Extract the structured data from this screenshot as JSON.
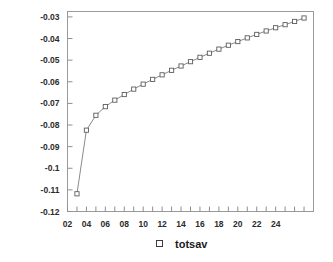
{
  "chart_data": {
    "type": "line",
    "title": "",
    "xlabel": "",
    "ylabel": "",
    "xlim": [
      2,
      28
    ],
    "ylim": [
      -0.12,
      -0.0275
    ],
    "grid": false,
    "legend_position": "bottom-center",
    "x_tick_labels": [
      "02",
      "04",
      "06",
      "08",
      "10",
      "12",
      "14",
      "16",
      "18",
      "20",
      "22",
      "24"
    ],
    "x_tick_values": [
      2,
      4,
      6,
      8,
      10,
      12,
      14,
      16,
      18,
      20,
      22,
      24
    ],
    "x_minor_tick_values": [
      3,
      5,
      7,
      9,
      11,
      13,
      15,
      17,
      19,
      21,
      23,
      25,
      26,
      27
    ],
    "y_tick_labels": [
      "-0.03",
      "-0.04",
      "-0.05",
      "-0.06",
      "-0.07",
      "-0.08",
      "-0.09",
      "-0.1",
      "-0.11",
      "-0.12"
    ],
    "y_tick_values": [
      -0.03,
      -0.04,
      -0.05,
      -0.06,
      -0.07,
      -0.08,
      -0.09,
      -0.1,
      -0.11,
      -0.12
    ],
    "series": [
      {
        "name": "totsav",
        "marker": "open-square",
        "x": [
          3,
          4,
          5,
          6,
          7,
          8,
          9,
          10,
          11,
          12,
          13,
          14,
          15,
          16,
          17,
          18,
          19,
          20,
          21,
          22,
          23,
          24,
          25,
          26,
          27
        ],
        "values": [
          -0.1118,
          -0.0824,
          -0.0755,
          -0.0715,
          -0.0685,
          -0.0659,
          -0.0634,
          -0.0611,
          -0.0589,
          -0.0568,
          -0.0547,
          -0.0527,
          -0.0507,
          -0.0487,
          -0.0468,
          -0.0449,
          -0.0431,
          -0.0414,
          -0.0397,
          -0.0381,
          -0.0365,
          -0.035,
          -0.0336,
          -0.0321,
          -0.0305
        ]
      }
    ]
  },
  "legend": {
    "marker_name": "open-square-marker",
    "label": "totsav"
  }
}
